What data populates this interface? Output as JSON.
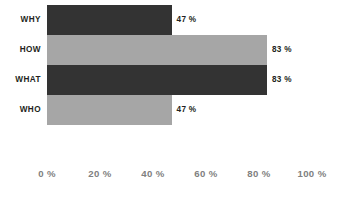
{
  "chart_data": {
    "type": "bar",
    "orientation": "horizontal",
    "title": "",
    "xlabel": "",
    "ylabel": "",
    "categories": [
      "WHY",
      "HOW",
      "WHAT",
      "WHO"
    ],
    "values": [
      47,
      83,
      83,
      47
    ],
    "value_labels": [
      "47 %",
      "83 %",
      "83 %",
      "47 %"
    ],
    "bar_colors": [
      "#333333",
      "#a6a6a6",
      "#333333",
      "#a6a6a6"
    ],
    "series": [
      {
        "name": "",
        "values": [
          47,
          83,
          83,
          47
        ]
      }
    ],
    "xlim": [
      0,
      100
    ],
    "xticks": [
      0,
      20,
      40,
      60,
      80,
      100
    ],
    "xtick_labels": [
      "0 %",
      "20 %",
      "40 %",
      "60 %",
      "80 %",
      "100 %"
    ],
    "grid": false,
    "legend": null,
    "unit": "%"
  },
  "colors": {
    "dark_bar": "#333333",
    "light_bar": "#a6a6a6",
    "category_text": "#231f20",
    "value_text": "#231f20",
    "tick_text": "#808080",
    "background": "#ffffff"
  },
  "bars": [
    {
      "category": "WHY",
      "value": 47,
      "value_label": "47 %",
      "color_key": "dark_bar"
    },
    {
      "category": "HOW",
      "value": 83,
      "value_label": "83 %",
      "color_key": "light_bar"
    },
    {
      "category": "WHAT",
      "value": 83,
      "value_label": "83 %",
      "color_key": "dark_bar"
    },
    {
      "category": "WHO",
      "value": 47,
      "value_label": "47 %",
      "color_key": "light_bar"
    }
  ],
  "axis": {
    "ticks": [
      {
        "label": "0 %",
        "value": 0
      },
      {
        "label": "20 %",
        "value": 20
      },
      {
        "label": "40 %",
        "value": 40
      },
      {
        "label": "60 %",
        "value": 60
      },
      {
        "label": "80 %",
        "value": 80
      },
      {
        "label": "100 %",
        "value": 100
      }
    ]
  }
}
